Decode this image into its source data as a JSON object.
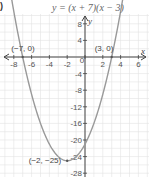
{
  "figure_label": ")",
  "chart_data": {
    "type": "line",
    "title": "y = (x + 7)(x − 3)",
    "equation": "y = (x + 7)(x - 3)",
    "xlabel": "x",
    "ylabel": "y",
    "xlim": [
      -8,
      6
    ],
    "ylim": [
      -28,
      8
    ],
    "grid": true,
    "x_ticks": [
      -8,
      -6,
      -4,
      -2,
      0,
      2,
      4,
      6
    ],
    "x_tick_labels": [
      "-8",
      "-6",
      "-4",
      "-2",
      "0",
      "2",
      "4",
      "6"
    ],
    "y_ticks": [
      8,
      4,
      -4,
      -8,
      -12,
      -16,
      -20,
      -24,
      -28
    ],
    "y_tick_labels": [
      "8",
      "4",
      "-4",
      "-8",
      "-12",
      "-16",
      "-20",
      "-24",
      "-28"
    ],
    "series": [
      {
        "name": "y = (x + 7)(x − 3)",
        "color": "#999999",
        "x": [
          -8.2,
          -8,
          -7,
          -6,
          -5,
          -4,
          -3,
          -2,
          -1,
          0,
          1,
          2,
          3,
          4,
          4.2
        ],
        "y": [
          11.44,
          11,
          0,
          -9,
          -16,
          -21,
          -24,
          -25,
          -24,
          -21,
          -16,
          -9,
          0,
          11,
          13.44
        ]
      }
    ],
    "annotations": [
      {
        "label": "(−7, 0)",
        "x": -7,
        "y": 0
      },
      {
        "label": "(3, 0)",
        "x": 3,
        "y": 0
      },
      {
        "label": "(−2, −25)",
        "x": -2,
        "y": -25
      }
    ]
  }
}
